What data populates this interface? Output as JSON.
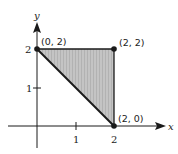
{
  "diagram": {
    "type": "coordinate-plane-region",
    "axes": {
      "x_label": "x",
      "y_label": "y",
      "x_ticks": [
        "1",
        "2"
      ],
      "y_ticks": [
        "1",
        "2"
      ]
    },
    "region": {
      "shape": "triangle",
      "vertices": [
        [
          0,
          2
        ],
        [
          2,
          2
        ],
        [
          2,
          0
        ]
      ],
      "fill": "#bdbdbd"
    },
    "points": [
      {
        "label": "(0, 2)"
      },
      {
        "label": "(2, 2)"
      },
      {
        "label": "(2, 0)"
      }
    ],
    "colors": {
      "line": "#1a1a1a",
      "shade": "#bdbdbd"
    }
  }
}
